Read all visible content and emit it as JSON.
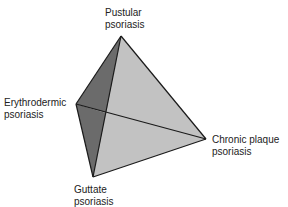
{
  "diagram": {
    "type": "tetrahedron",
    "colors": {
      "dark_face": "#6b6b6b",
      "light_face": "#c2c2c2",
      "edge": "#1a1a1a",
      "text": "#222222"
    },
    "vertices": {
      "top": {
        "line1": "Pustular",
        "line2": "psoriasis"
      },
      "left": {
        "line1": "Erythrodermic",
        "line2": "psoriasis"
      },
      "bottom": {
        "line1": "Guttate",
        "line2": "psoriasis"
      },
      "right": {
        "line1": "Chronic plaque",
        "line2": "psoriasis"
      }
    }
  }
}
